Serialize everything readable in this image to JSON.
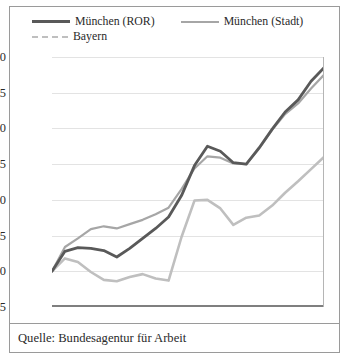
{
  "source": {
    "text": "Quelle: Bundesagentur für Arbeit"
  },
  "legend": {
    "items": [
      {
        "label": "München (ROR)",
        "key": "ror",
        "color": "#595959",
        "style": "solid"
      },
      {
        "label": "München (Stadt)",
        "key": "stadt",
        "color": "#a6a6a6",
        "style": "solid"
      },
      {
        "label": "Bayern",
        "key": "bayern",
        "color": "#bfbfbf",
        "style": "dashed"
      }
    ]
  },
  "chart_data": {
    "type": "line",
    "title": "",
    "subtitle": "",
    "xlabel": "",
    "ylabel": "",
    "xlim": [
      1991,
      2012
    ],
    "ylim": [
      95,
      130
    ],
    "ytick_values": [
      95,
      100,
      105,
      110,
      115,
      120,
      125,
      130
    ],
    "ytick_labels": [
      "95",
      "100",
      "105",
      "110",
      "115",
      "120",
      "125",
      "130"
    ],
    "xtick_values": [
      1991,
      1996,
      2001,
      2006,
      2011
    ],
    "xtick_labels": [
      "1991",
      "1996",
      "2001",
      "2006",
      "2011"
    ],
    "grid": "horizontal",
    "legend_position": "top",
    "x": [
      1991,
      1992,
      1993,
      1994,
      1995,
      1996,
      1997,
      1998,
      1999,
      2000,
      2001,
      2002,
      2003,
      2004,
      2005,
      2006,
      2007,
      2008,
      2009,
      2010,
      2011,
      2012
    ],
    "series": [
      {
        "name": "München (ROR)",
        "color": "#595959",
        "style": "solid",
        "values": [
          100.0,
          102.8,
          103.3,
          103.2,
          102.9,
          102.0,
          103.2,
          104.6,
          106.0,
          107.6,
          110.6,
          114.8,
          117.5,
          116.8,
          115.2,
          115.0,
          117.3,
          119.9,
          122.3,
          124.0,
          126.6,
          128.5
        ]
      },
      {
        "name": "München (Stadt)",
        "color": "#a6a6a6",
        "style": "solid",
        "values": [
          100.0,
          103.4,
          104.6,
          105.9,
          106.3,
          106.0,
          106.6,
          107.2,
          108.0,
          108.9,
          111.5,
          114.4,
          116.1,
          115.9,
          115.1,
          115.0,
          117.2,
          119.8,
          122.0,
          123.5,
          125.6,
          127.5
        ]
      },
      {
        "name": "Bayern",
        "color": "#bfbfbf",
        "style": "solid",
        "values": [
          100.0,
          101.8,
          101.3,
          99.9,
          98.8,
          98.6,
          99.2,
          99.6,
          99.0,
          98.7,
          104.8,
          109.9,
          110.0,
          108.8,
          106.5,
          107.5,
          107.8,
          109.2,
          111.0,
          112.6,
          114.3,
          116.0
        ]
      }
    ]
  }
}
